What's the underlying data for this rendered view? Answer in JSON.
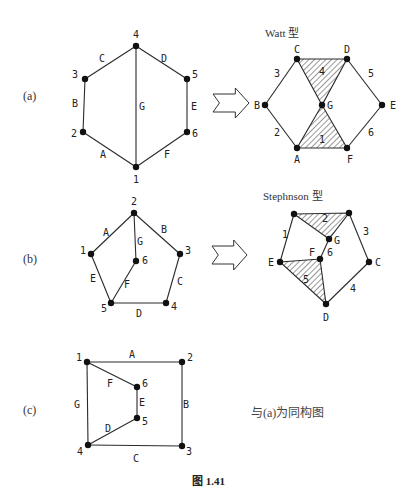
{
  "figure": {
    "caption": "图 1.41",
    "panels": [
      {
        "id": "a",
        "label": "(a)",
        "graph": {
          "vertices": [
            {
              "name": "1",
              "x": 136,
              "y": 167,
              "lx": 133,
              "ly": 183
            },
            {
              "name": "2",
              "x": 83,
              "y": 132,
              "lx": 71,
              "ly": 137
            },
            {
              "name": "3",
              "x": 85,
              "y": 79,
              "lx": 72,
              "ly": 78
            },
            {
              "name": "4",
              "x": 136,
              "y": 46,
              "lx": 133,
              "ly": 38
            },
            {
              "name": "5",
              "x": 187,
              "y": 79,
              "lx": 192,
              "ly": 78
            },
            {
              "name": "6",
              "x": 187,
              "y": 132,
              "lx": 192,
              "ly": 137
            }
          ],
          "edges": [
            {
              "name": "A",
              "from": "2",
              "to": "1",
              "lx": 100,
              "ly": 158
            },
            {
              "name": "B",
              "from": "3",
              "to": "2",
              "lx": 72,
              "ly": 107
            },
            {
              "name": "C",
              "from": "3",
              "to": "4",
              "lx": 99,
              "ly": 62
            },
            {
              "name": "D",
              "from": "4",
              "to": "5",
              "lx": 161,
              "ly": 62
            },
            {
              "name": "E",
              "from": "5",
              "to": "6",
              "lx": 191,
              "ly": 110
            },
            {
              "name": "F",
              "from": "6",
              "to": "1",
              "lx": 164,
              "ly": 158
            },
            {
              "name": "G",
              "from": "4",
              "to": "1",
              "lx": 139,
              "ly": 110
            }
          ]
        },
        "arrow": {
          "x": 213,
          "y": 88,
          "w": 36,
          "h": 30
        },
        "result": {
          "title": "Watt 型",
          "vertices": [
            {
              "name": "A",
              "x": 297,
              "y": 148,
              "lx": 294,
              "ly": 163
            },
            {
              "name": "B",
              "x": 265,
              "y": 105,
              "lx": 254,
              "ly": 109
            },
            {
              "name": "C",
              "x": 297,
              "y": 59,
              "lx": 294,
              "ly": 53
            },
            {
              "name": "D",
              "x": 347,
              "y": 59,
              "lx": 344,
              "ly": 53
            },
            {
              "name": "E",
              "x": 382,
              "y": 105,
              "lx": 390,
              "ly": 109
            },
            {
              "name": "F",
              "x": 347,
              "y": 148,
              "lx": 347,
              "ly": 163
            },
            {
              "name": "G",
              "x": 322,
              "y": 105,
              "lx": 327,
              "ly": 109
            }
          ],
          "edges": [
            {
              "name": "2",
              "from": "B",
              "to": "A",
              "lx": 274,
              "ly": 136
            },
            {
              "name": "3",
              "from": "B",
              "to": "C",
              "lx": 274,
              "ly": 77
            },
            {
              "name": "5",
              "from": "D",
              "to": "E",
              "lx": 368,
              "ly": 77
            },
            {
              "name": "6",
              "from": "E",
              "to": "F",
              "lx": 368,
              "ly": 136
            }
          ],
          "links": [
            {
              "name": "4",
              "points": [
                "C",
                "D",
                "G"
              ],
              "lx": 319,
              "ly": 75
            },
            {
              "name": "1",
              "points": [
                "A",
                "F",
                "G"
              ],
              "lx": 319,
              "ly": 143
            }
          ]
        }
      },
      {
        "id": "b",
        "label": "(b)",
        "graph": {
          "vertices": [
            {
              "name": "1",
              "x": 91,
              "y": 254,
              "lx": 80,
              "ly": 254
            },
            {
              "name": "2",
              "x": 134,
              "y": 213,
              "lx": 131,
              "ly": 205
            },
            {
              "name": "3",
              "x": 180,
              "y": 254,
              "lx": 185,
              "ly": 254
            },
            {
              "name": "4",
              "x": 166,
              "y": 303,
              "lx": 171,
              "ly": 310
            },
            {
              "name": "5",
              "x": 111,
              "y": 303,
              "lx": 101,
              "ly": 312
            },
            {
              "name": "6",
              "x": 136,
              "y": 261,
              "lx": 142,
              "ly": 264
            }
          ],
          "edges": [
            {
              "name": "A",
              "from": "1",
              "to": "2",
              "lx": 103,
              "ly": 236
            },
            {
              "name": "B",
              "from": "2",
              "to": "3",
              "lx": 161,
              "ly": 233
            },
            {
              "name": "C",
              "from": "3",
              "to": "4",
              "lx": 177,
              "ly": 285
            },
            {
              "name": "D",
              "from": "5",
              "to": "4",
              "lx": 136,
              "ly": 317
            },
            {
              "name": "E",
              "from": "1",
              "to": "5",
              "lx": 90,
              "ly": 282
            },
            {
              "name": "F",
              "from": "6",
              "to": "5",
              "lx": 124,
              "ly": 288
            },
            {
              "name": "G",
              "from": "2",
              "to": "6",
              "lx": 137,
              "ly": 245
            }
          ]
        },
        "arrow": {
          "x": 212,
          "y": 240,
          "w": 35,
          "h": 30
        },
        "result": {
          "title": "Stephnson 型",
          "vertices": [
            {
              "name": "",
              "x": 294,
              "y": 214,
              "lx": 0,
              "ly": 0
            },
            {
              "name": "",
              "x": 349,
              "y": 213,
              "lx": 0,
              "ly": 0
            },
            {
              "name": "G",
              "x": 329,
              "y": 239,
              "lx": 334,
              "ly": 244
            },
            {
              "name": "F",
              "x": 320,
              "y": 259,
              "lx": 309,
              "ly": 256
            },
            {
              "name": "E",
              "x": 280,
              "y": 262,
              "lx": 268,
              "ly": 266
            },
            {
              "name": "C",
              "x": 369,
              "y": 262,
              "lx": 375,
              "ly": 266
            },
            {
              "name": "D",
              "x": 326,
              "y": 304,
              "lx": 323,
              "ly": 321
            }
          ],
          "edges": [
            {
              "name": "1",
              "from": 0,
              "to": 4,
              "lx": 282,
              "ly": 238
            },
            {
              "name": "3",
              "from": 1,
              "to": 5,
              "lx": 363,
              "ly": 235
            },
            {
              "name": "4",
              "from": 5,
              "to": 6,
              "lx": 350,
              "ly": 292
            },
            {
              "name": "6",
              "from": 2,
              "to": 3,
              "lx": 327,
              "ly": 256
            }
          ],
          "links": [
            {
              "name": "2",
              "points": [
                0,
                1,
                2
              ],
              "lx": 322,
              "ly": 222
            },
            {
              "name": "5",
              "points": [
                4,
                3,
                6
              ],
              "lx": 303,
              "ly": 283
            }
          ]
        }
      },
      {
        "id": "c",
        "label": "(c)",
        "graph": {
          "vertices": [
            {
              "name": "1",
              "x": 87,
              "y": 362,
              "lx": 76,
              "ly": 361
            },
            {
              "name": "2",
              "x": 182,
              "y": 362,
              "lx": 187,
              "ly": 361
            },
            {
              "name": "3",
              "x": 182,
              "y": 446,
              "lx": 186,
              "ly": 455
            },
            {
              "name": "4",
              "x": 88,
              "y": 445,
              "lx": 77,
              "ly": 455
            },
            {
              "name": "5",
              "x": 137,
              "y": 418,
              "lx": 142,
              "ly": 425
            },
            {
              "name": "6",
              "x": 137,
              "y": 387,
              "lx": 142,
              "ly": 387
            }
          ],
          "edges": [
            {
              "name": "A",
              "from": "1",
              "to": "2",
              "lx": 129,
              "ly": 358
            },
            {
              "name": "B",
              "from": "2",
              "to": "3",
              "lx": 183,
              "ly": 408
            },
            {
              "name": "C",
              "from": "4",
              "to": "3",
              "lx": 133,
              "ly": 462
            },
            {
              "name": "D",
              "from": "4",
              "to": "5",
              "lx": 105,
              "ly": 432
            },
            {
              "name": "E",
              "from": "6",
              "to": "5",
              "lx": 139,
              "ly": 406
            },
            {
              "name": "F",
              "from": "1",
              "to": "6",
              "lx": 107,
              "ly": 387
            },
            {
              "name": "G",
              "from": "1",
              "to": "4",
              "lx": 74,
              "ly": 408
            }
          ]
        },
        "note": "与(a)为同构图"
      }
    ]
  }
}
